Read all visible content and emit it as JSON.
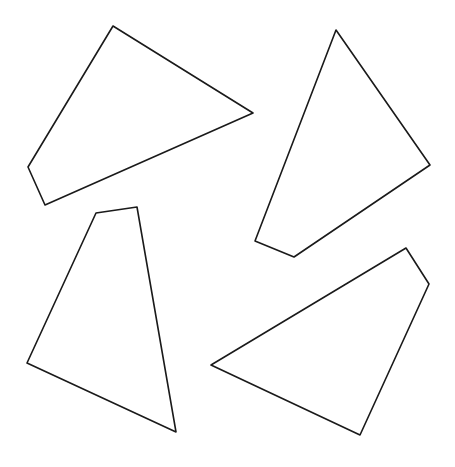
{
  "diagram": {
    "background": "#ffffff",
    "stroke_color": "#1a1a1a",
    "stroke_width": 1.6,
    "shapes": [
      {
        "name": "quadrilateral-top-left",
        "points": "113,26 253,113 45,205 28,167"
      },
      {
        "name": "quadrilateral-top-right",
        "points": "336,30 430,165 294,257 255,241"
      },
      {
        "name": "quadrilateral-bottom-left",
        "points": "96,213 137,207 176,432 27,363"
      },
      {
        "name": "quadrilateral-bottom-right",
        "points": "406,248 429,284 360,435 211,365"
      }
    ]
  }
}
